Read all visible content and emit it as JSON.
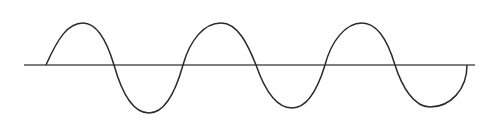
{
  "diagram": {
    "type": "waveform",
    "colors": {
      "background": "#ffffff",
      "axis": "#555555",
      "wave": "#2a2a2a"
    },
    "axis": {
      "x1": 24,
      "x2": 475,
      "y": 65
    },
    "wave": {
      "cycles": 3,
      "start_x": 46,
      "end_x": 467,
      "baseline_y": 65,
      "peaks": [
        [
          83,
          23
        ],
        [
          221,
          23
        ],
        [
          362,
          23
        ]
      ],
      "troughs": [
        [
          149,
          113
        ],
        [
          292,
          108
        ],
        [
          430,
          107
        ]
      ],
      "zero_crossings": [
        46,
        114,
        183,
        256,
        325,
        395,
        467
      ]
    }
  }
}
